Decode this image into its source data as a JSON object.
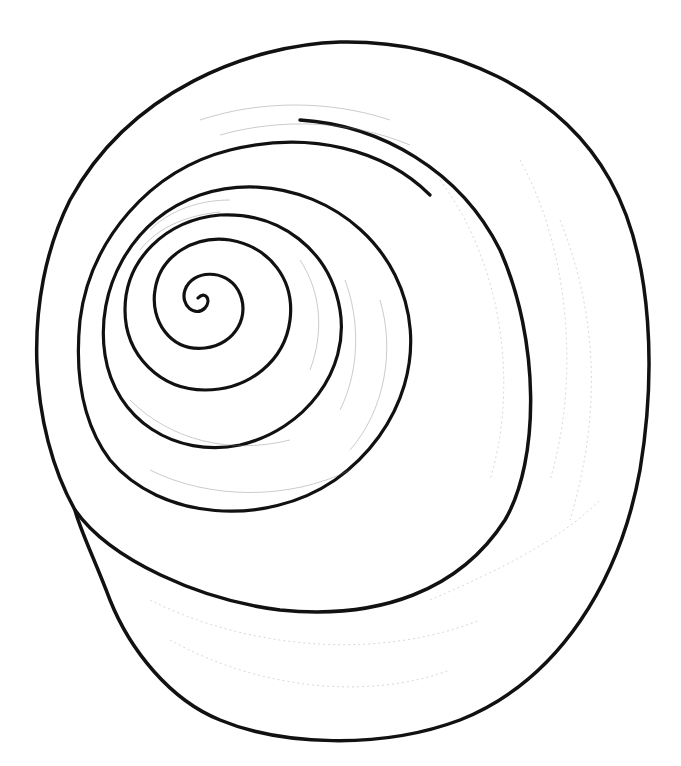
{
  "illustration": {
    "subject": "shell-apex-view-drawing",
    "background": "#ffffff",
    "ink": "#111111",
    "style": "pen-and-ink line drawing with stipple hatching"
  }
}
